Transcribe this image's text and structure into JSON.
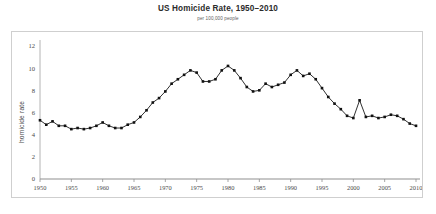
{
  "chart_data": {
    "type": "line",
    "title": "US Homicide Rate, 1950–2010",
    "subtitle": "per 100,000 people",
    "xlabel": "",
    "ylabel": "homicide rate",
    "xlim": [
      1950,
      2010
    ],
    "ylim": [
      0,
      12
    ],
    "grid": false,
    "legend": "none",
    "marker": "square",
    "marker_color": "#111111",
    "line_color": "#1a1a1a",
    "xticks": [
      1950,
      1955,
      1960,
      1965,
      1970,
      1975,
      1980,
      1985,
      1990,
      1995,
      2000,
      2005,
      2010
    ],
    "xtick_labels": [
      "1950",
      "1955",
      "1960",
      "1965",
      "1970",
      "1975",
      "1980",
      "1985",
      "1990",
      "1995",
      "2000",
      "2005",
      "2010"
    ],
    "yticks": [
      0,
      2,
      4,
      6,
      8,
      10,
      12
    ],
    "ytick_labels": [
      "0",
      "2",
      "4",
      "6",
      "8",
      "10",
      "12"
    ],
    "x": [
      1950,
      1951,
      1952,
      1953,
      1954,
      1955,
      1956,
      1957,
      1958,
      1959,
      1960,
      1961,
      1962,
      1963,
      1964,
      1965,
      1966,
      1967,
      1968,
      1969,
      1970,
      1971,
      1972,
      1973,
      1974,
      1975,
      1976,
      1977,
      1978,
      1979,
      1980,
      1981,
      1982,
      1983,
      1984,
      1985,
      1986,
      1987,
      1988,
      1989,
      1990,
      1991,
      1992,
      1993,
      1994,
      1995,
      1996,
      1997,
      1998,
      1999,
      2000,
      2001,
      2002,
      2003,
      2004,
      2005,
      2006,
      2007,
      2008,
      2009,
      2010
    ],
    "values": [
      5.3,
      4.9,
      5.2,
      4.8,
      4.8,
      4.5,
      4.6,
      4.5,
      4.6,
      4.8,
      5.1,
      4.8,
      4.6,
      4.6,
      4.9,
      5.1,
      5.6,
      6.2,
      6.9,
      7.3,
      7.9,
      8.6,
      9.0,
      9.4,
      9.8,
      9.6,
      8.8,
      8.8,
      9.0,
      9.8,
      10.2,
      9.8,
      9.1,
      8.3,
      7.9,
      8.0,
      8.6,
      8.3,
      8.5,
      8.7,
      9.4,
      9.8,
      9.3,
      9.5,
      9.0,
      8.2,
      7.4,
      6.8,
      6.3,
      5.7,
      5.5,
      7.1,
      5.6,
      5.7,
      5.5,
      5.6,
      5.8,
      5.7,
      5.4,
      5.0,
      4.8
    ]
  }
}
